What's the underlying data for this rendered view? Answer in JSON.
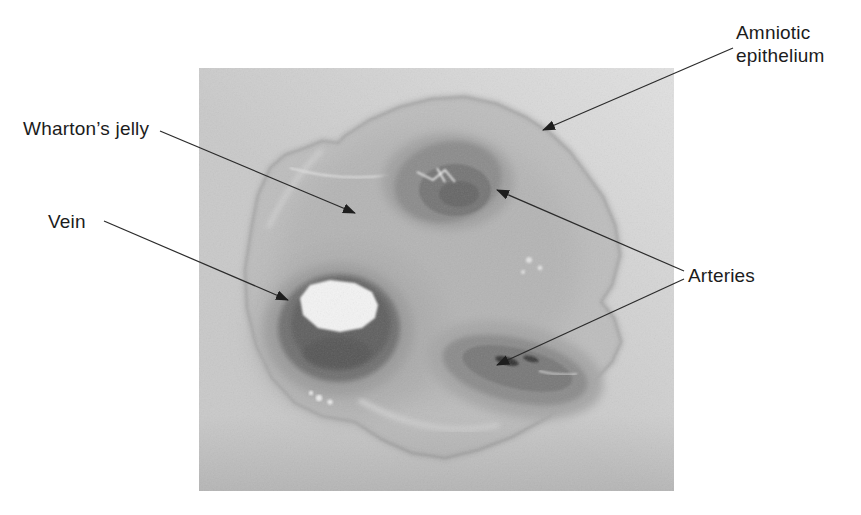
{
  "figure": {
    "labels": {
      "amniotic_epithelium": "Amniotic epithelium",
      "whartons_jelly": "Wharton’s jelly",
      "vein": "Vein",
      "arteries": "Arteries"
    },
    "arrow_counts": {
      "amniotic_epithelium": 1,
      "whartons_jelly": 1,
      "vein": 1,
      "arteries": 2
    },
    "colors": {
      "page_bg": "#ffffff",
      "photo_bg": "#c9c9c9",
      "tissue": "#bdbdbd",
      "vessel_ring": "#6f6f6f",
      "artery_band": "#8b8b8b",
      "lumen_white": "#f3f3f3",
      "annotation": "#2b2b2b",
      "label_text": "#1c1c1c"
    }
  }
}
